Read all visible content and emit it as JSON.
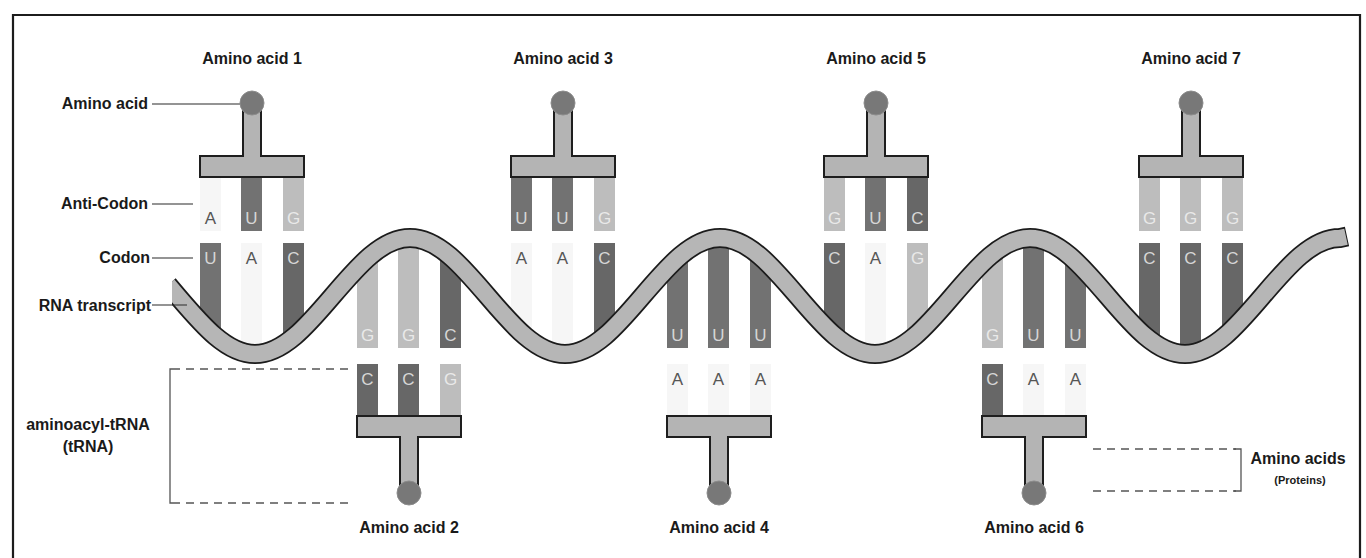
{
  "labels": {
    "amino_acid": "Amino acid",
    "anti_codon": "Anti-Codon",
    "codon": "Codon",
    "rna_transcript": "RNA transcript",
    "aminoacyl_trna_line1": "aminoacyl-tRNA",
    "aminoacyl_trna_line2": "(tRNA)",
    "amino_acids": "Amino acids",
    "proteins": "(Proteins)"
  },
  "trnas": [
    {
      "label": "Amino acid 1",
      "side": "top",
      "anticodon": [
        "A",
        "U",
        "G"
      ],
      "codon": [
        "U",
        "A",
        "C"
      ]
    },
    {
      "label": "Amino acid 2",
      "side": "bottom",
      "codon": [
        "G",
        "G",
        "C"
      ],
      "anticodon": [
        "C",
        "C",
        "G"
      ]
    },
    {
      "label": "Amino acid 3",
      "side": "top",
      "anticodon": [
        "U",
        "U",
        "G"
      ],
      "codon": [
        "A",
        "A",
        "C"
      ]
    },
    {
      "label": "Amino acid 4",
      "side": "bottom",
      "codon": [
        "U",
        "U",
        "U"
      ],
      "anticodon": [
        "A",
        "A",
        "A"
      ]
    },
    {
      "label": "Amino acid 5",
      "side": "top",
      "anticodon": [
        "G",
        "U",
        "C"
      ],
      "codon": [
        "C",
        "A",
        "G"
      ]
    },
    {
      "label": "Amino acid 6",
      "side": "bottom",
      "codon": [
        "G",
        "U",
        "U"
      ],
      "anticodon": [
        "C",
        "A",
        "A"
      ]
    },
    {
      "label": "Amino acid 7",
      "side": "top",
      "anticodon": [
        "G",
        "G",
        "G"
      ],
      "codon": [
        "C",
        "C",
        "C"
      ]
    }
  ],
  "nucleotide_colors": {
    "A": {
      "bar": "#f6f6f6",
      "text": "#555555"
    },
    "U": {
      "bar": "#727272",
      "text": "#d6d6d6"
    },
    "C": {
      "bar": "#676767",
      "text": "#d6d6d6"
    },
    "G": {
      "bar": "#bdbdbd",
      "text": "#e9e9e9"
    }
  },
  "colors": {
    "trna_body": "#b4b4b4",
    "amino_acid_ball": "#787878",
    "rna_strand": "#b6b6b6",
    "outline": "#1c1c1c"
  }
}
